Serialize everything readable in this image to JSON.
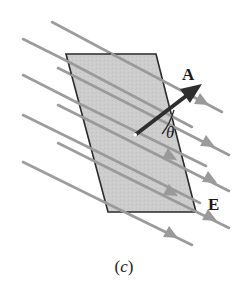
{
  "figure": {
    "caption_open": "(",
    "caption_letter": "c",
    "caption_close": ")",
    "vector_label": "A",
    "field_label": "E",
    "angle_label": "θ",
    "colors": {
      "surface_fill": "#cfcfcf",
      "surface_edge": "#2a2a2a",
      "field_lines": "#9a9a9a",
      "area_vector": "#2d2d2d",
      "text": "#1a1a1a"
    }
  }
}
